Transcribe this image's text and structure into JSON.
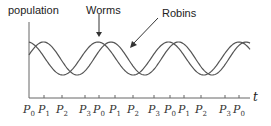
{
  "chart_data": {
    "type": "line",
    "title": "",
    "ylabel": "population",
    "xlabel": "t",
    "series": [
      {
        "name": "Worms",
        "phase_peak_x": [
          98,
          166,
          239
        ],
        "color": "#555555"
      },
      {
        "name": "Robins",
        "phase_peak_x": [
          43,
          113,
          178
        ],
        "color": "#555555"
      }
    ],
    "annotations": [
      {
        "text": "Worms",
        "arrow_to": "worms peak"
      },
      {
        "text": "Robins",
        "arrow_to": "robins curve descending"
      }
    ],
    "x_ticks": [
      "P0",
      "P1",
      "P2",
      "P3",
      "P0",
      "P1",
      "P2",
      "P3",
      "P0",
      "P1",
      "P2",
      "P3",
      "P0"
    ],
    "grid": false,
    "legend": "none"
  },
  "labels": {
    "population": "population",
    "worms": "Worms",
    "robins": "Robins",
    "t": "t"
  },
  "ticks": [
    {
      "x": 29,
      "sub": "0"
    },
    {
      "x": 44,
      "sub": "1"
    },
    {
      "x": 62,
      "sub": "2"
    },
    {
      "x": 85,
      "sub": "3"
    },
    {
      "x": 99,
      "sub": "0"
    },
    {
      "x": 115,
      "sub": "1"
    },
    {
      "x": 133,
      "sub": "2"
    },
    {
      "x": 154,
      "sub": "3"
    },
    {
      "x": 170,
      "sub": "0"
    },
    {
      "x": 184,
      "sub": "1"
    },
    {
      "x": 201,
      "sub": "2"
    },
    {
      "x": 225,
      "sub": "3"
    },
    {
      "x": 239,
      "sub": "0"
    }
  ]
}
